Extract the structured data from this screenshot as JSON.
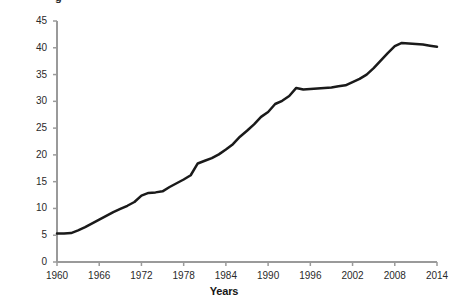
{
  "figure": {
    "cropped_title_fragment": "g",
    "background_color": "#ffffff"
  },
  "colors": {
    "line": "#1a1a1a",
    "axis": "#9a9a9a",
    "tick_text": "#2a2a2a",
    "axis_title": "#161616"
  },
  "axes": {
    "x_title": "Years",
    "y_title": "Share of total births, %",
    "x_ticks": [
      "1960",
      "1966",
      "1972",
      "1978",
      "1984",
      "1990",
      "1996",
      "2002",
      "2008",
      "2014"
    ],
    "y_ticks": [
      "0",
      "5",
      "10",
      "15",
      "20",
      "25",
      "30",
      "35",
      "40",
      "45"
    ]
  },
  "chart_data": {
    "type": "line",
    "title": "",
    "subtitle": "",
    "xlabel": "Years",
    "ylabel": "Share of total births, %",
    "xlim": [
      1960,
      2014
    ],
    "ylim": [
      0,
      45
    ],
    "xticks": [
      1960,
      1966,
      1972,
      1978,
      1984,
      1990,
      1996,
      2002,
      2008,
      2014
    ],
    "yticks": [
      0,
      5,
      10,
      15,
      20,
      25,
      30,
      35,
      40,
      45
    ],
    "grid": false,
    "legend": false,
    "legend_position": "none",
    "line_color": "#1a1a1a",
    "line_width": 2.5,
    "markers": false,
    "x": [
      1960,
      1961,
      1962,
      1963,
      1964,
      1965,
      1966,
      1967,
      1968,
      1969,
      1970,
      1971,
      1972,
      1973,
      1974,
      1975,
      1976,
      1977,
      1978,
      1979,
      1980,
      1981,
      1982,
      1983,
      1984,
      1985,
      1986,
      1987,
      1988,
      1989,
      1990,
      1991,
      1992,
      1993,
      1994,
      1995,
      1996,
      1997,
      1998,
      1999,
      2000,
      2001,
      2002,
      2003,
      2004,
      2005,
      2006,
      2007,
      2008,
      2009,
      2010,
      2011,
      2012,
      2013,
      2014
    ],
    "values": [
      5.3,
      5.3,
      5.4,
      5.9,
      6.5,
      7.2,
      7.9,
      8.6,
      9.3,
      9.9,
      10.5,
      11.2,
      12.4,
      12.9,
      13.0,
      13.2,
      14.0,
      14.7,
      15.4,
      16.2,
      18.4,
      18.9,
      19.4,
      20.1,
      21.0,
      22.0,
      23.4,
      24.5,
      25.7,
      27.1,
      28.0,
      29.5,
      30.1,
      31.0,
      32.5,
      32.2,
      32.3,
      32.4,
      32.5,
      32.6,
      32.8,
      33.0,
      33.6,
      34.2,
      35.0,
      36.2,
      37.6,
      39.0,
      40.3,
      40.9,
      40.8,
      40.7,
      40.6,
      40.4,
      40.2
    ],
    "series": [
      {
        "name": "Share of total births",
        "values": [
          5.3,
          5.3,
          5.4,
          5.9,
          6.5,
          7.2,
          7.9,
          8.6,
          9.3,
          9.9,
          10.5,
          11.2,
          12.4,
          12.9,
          13.0,
          13.2,
          14.0,
          14.7,
          15.4,
          16.2,
          18.4,
          18.9,
          19.4,
          20.1,
          21.0,
          22.0,
          23.4,
          24.5,
          25.7,
          27.1,
          28.0,
          29.5,
          30.1,
          31.0,
          32.5,
          32.2,
          32.3,
          32.4,
          32.5,
          32.6,
          32.8,
          33.0,
          33.6,
          34.2,
          35.0,
          36.2,
          37.6,
          39.0,
          40.3,
          40.9,
          40.8,
          40.7,
          40.6,
          40.4,
          40.2
        ]
      }
    ],
    "annotations": []
  },
  "plot_geometry": {
    "left": 57,
    "right": 437,
    "top": 21,
    "bottom": 262
  }
}
